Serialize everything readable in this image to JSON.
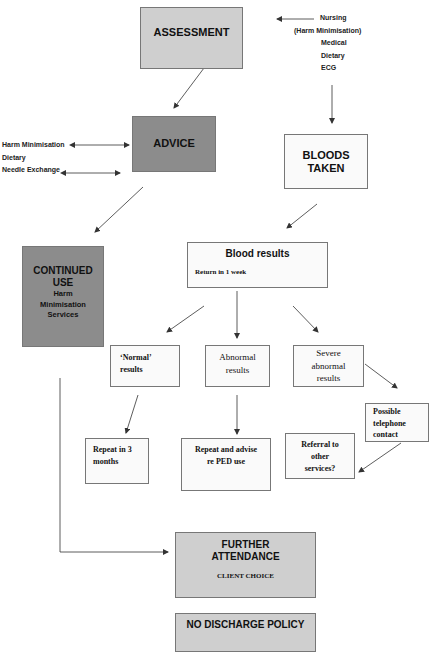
{
  "colors": {
    "light_grey": "#cfcfcf",
    "dark_grey": "#8c8c8c",
    "box_fill": "#fafafa",
    "line": "#333333"
  },
  "assessment": {
    "title": "ASSESSMENT"
  },
  "assessment_inputs": {
    "items": [
      "Nursing",
      "(Harm Minimisation)",
      "Medical",
      "Dietary",
      "ECG"
    ]
  },
  "advice": {
    "title": "ADVICE"
  },
  "advice_inputs": {
    "items": [
      "Harm Minimisation",
      "Dietary",
      "Needle Exchange"
    ]
  },
  "bloods_taken": {
    "line1": "BLOODS",
    "line2": "TAKEN"
  },
  "blood_results": {
    "title": "Blood results",
    "subtitle": "Return in 1 week"
  },
  "continued_use": {
    "line1": "CONTINUED",
    "line2": "USE",
    "line3": "Harm",
    "line4": "Minimisation",
    "line5": "Services"
  },
  "normal_results": {
    "line1": "‘Normal’",
    "line2": "results"
  },
  "abnormal_results": {
    "line1": "Abnormal",
    "line2": "results"
  },
  "severe_results": {
    "line1": "Severe",
    "line2": "abnormal",
    "line3": "results"
  },
  "telephone_contact": {
    "line1": "Possible",
    "line2": "telephone",
    "line3": "contact"
  },
  "repeat_3_months": {
    "line1": "Repeat in 3",
    "line2": "months"
  },
  "repeat_advise": {
    "line1": "Repeat and advise",
    "line2": "re PED use"
  },
  "referral": {
    "line1": "Referral to",
    "line2": "other",
    "line3": "services?"
  },
  "further_attendance": {
    "line1": "FURTHER",
    "line2": "ATTENDANCE",
    "line3": "CLIENT CHOICE"
  },
  "no_discharge": {
    "title": "NO DISCHARGE POLICY"
  }
}
